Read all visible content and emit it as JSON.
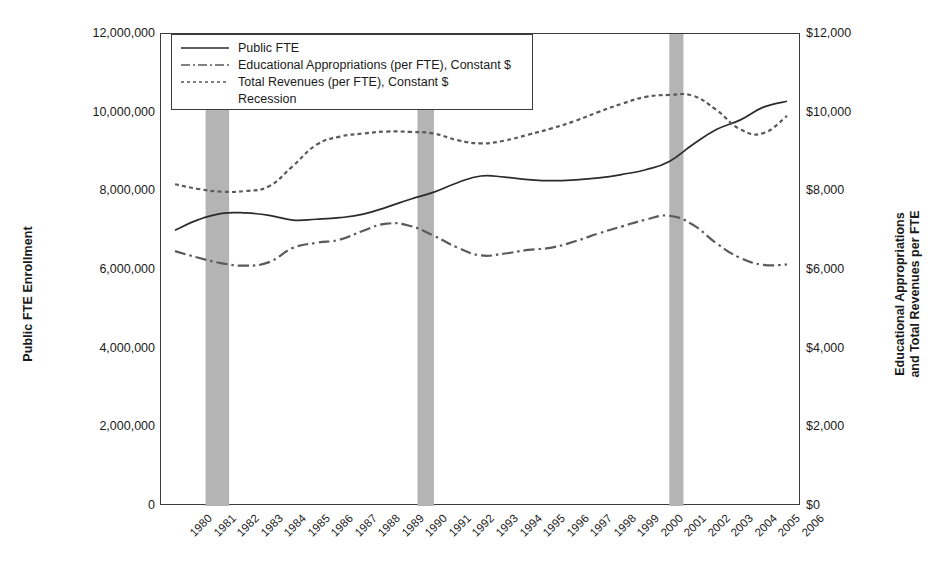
{
  "chart_data": {
    "type": "line",
    "title": "",
    "xlabel": "",
    "ylabel": "Public FTE Enrollment",
    "ylabel_right_line1": "Educational Appropriations",
    "ylabel_right_line2": "and Total Revenues per FTE",
    "grid": false,
    "legend_position": "top-left",
    "x": [
      1980,
      1981,
      1982,
      1983,
      1984,
      1985,
      1986,
      1987,
      1988,
      1989,
      1990,
      1991,
      1992,
      1993,
      1994,
      1995,
      1996,
      1997,
      1998,
      1999,
      2000,
      2001,
      2002,
      2003,
      2004,
      2005,
      2006
    ],
    "xticklabels": [
      "1980",
      "1981",
      "1982",
      "1983",
      "1984",
      "1985",
      "1986",
      "1987",
      "1988",
      "1989",
      "1990",
      "1991",
      "1992",
      "1993",
      "1994",
      "1995",
      "1996",
      "1997",
      "1998",
      "1999",
      "2000",
      "2001",
      "2002",
      "2003",
      "2004",
      "2005",
      "2006"
    ],
    "yticklabels_left": [
      "0",
      "2,000,000",
      "4,000,000",
      "6,000,000",
      "8,000,000",
      "10,000,000",
      "12,000,000"
    ],
    "yticklabels_right": [
      "$0",
      "$2,000",
      "$4,000",
      "$6,000",
      "$8,000",
      "$10,000",
      "$12,000"
    ],
    "ylim_left": [
      0,
      12000000
    ],
    "ylim_right": [
      0,
      12000
    ],
    "ytick_values_left": [
      0,
      2000000,
      4000000,
      6000000,
      8000000,
      10000000,
      12000000
    ],
    "ytick_values_right": [
      0,
      2000,
      4000,
      6000,
      8000,
      10000,
      12000
    ],
    "series": [
      {
        "name": "Public FTE",
        "axis": "left",
        "style": "solid",
        "color": "#2b2b2b",
        "values": [
          7010000,
          7280000,
          7440000,
          7450000,
          7390000,
          7270000,
          7290000,
          7330000,
          7420000,
          7600000,
          7800000,
          7980000,
          8220000,
          8390000,
          8360000,
          8300000,
          8270000,
          8290000,
          8340000,
          8430000,
          8550000,
          8760000,
          9190000,
          9570000,
          9810000,
          10140000,
          10290000
        ]
      },
      {
        "name": "Educational Appropriations (per FTE), Constant $",
        "axis": "right",
        "style": "dashdot",
        "color": "#5a5a5a",
        "values": [
          6480,
          6310,
          6170,
          6110,
          6200,
          6560,
          6690,
          6770,
          7000,
          7180,
          7120,
          6870,
          6570,
          6370,
          6420,
          6510,
          6570,
          6730,
          6930,
          7110,
          7280,
          7380,
          7150,
          6680,
          6310,
          6130,
          6140
        ]
      },
      {
        "name": "Total Revenues (per FTE), Constant $",
        "axis": "right",
        "style": "dotted",
        "color": "#5a5a5a",
        "values": [
          8180,
          8060,
          7990,
          8010,
          8130,
          8640,
          9180,
          9390,
          9470,
          9520,
          9510,
          9470,
          9300,
          9220,
          9290,
          9440,
          9600,
          9790,
          10020,
          10230,
          10400,
          10450,
          10430,
          10070,
          9580,
          9480,
          9920
        ]
      }
    ],
    "recessions": [
      {
        "label": "Recession",
        "start": 1981.3,
        "end": 1982.3
      },
      {
        "label": "Recession",
        "start": 1990.3,
        "end": 1991.0
      },
      {
        "label": "Recession",
        "start": 2001.0,
        "end": 2001.6
      }
    ],
    "recession_color": "#b4b4b4",
    "legend_entries": [
      {
        "label": "Public FTE",
        "style": "solid"
      },
      {
        "label": "Educational Appropriations (per FTE), Constant $",
        "style": "dashdot"
      },
      {
        "label": "Total Revenues (per FTE), Constant $",
        "style": "dotted"
      },
      {
        "label": "Recession",
        "style": "swatch"
      }
    ]
  }
}
